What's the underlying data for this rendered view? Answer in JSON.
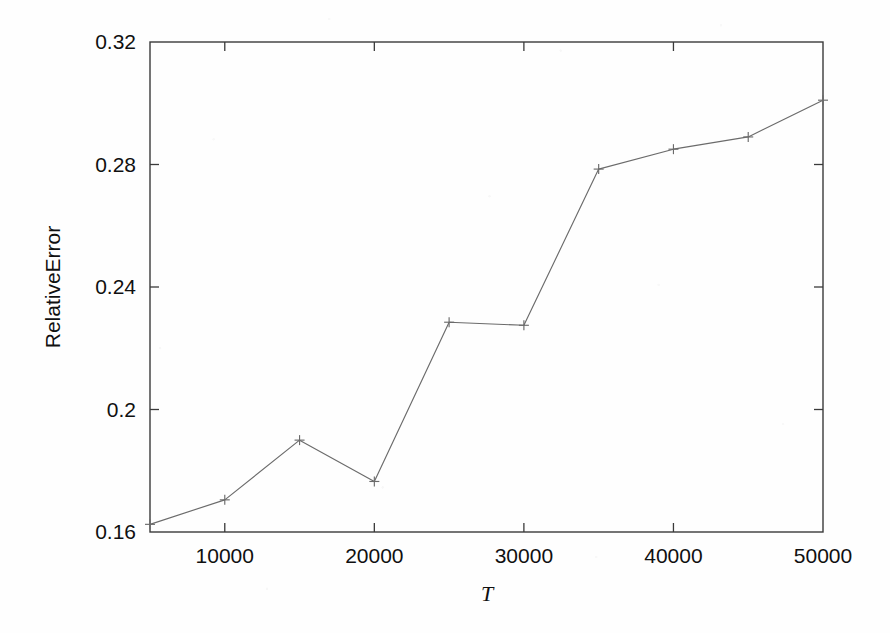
{
  "figure": {
    "background_color": "#fefefe",
    "line_color": "#6b6b6b",
    "axis_color": "#3a3a3a",
    "text_color": "#101010",
    "marker": "plus"
  },
  "chart_data": {
    "type": "line",
    "title": "",
    "subtitle": "",
    "xlabel": "T",
    "ylabel": "RelativeError",
    "x": [
      5000,
      10000,
      15000,
      20000,
      25000,
      30000,
      35000,
      40000,
      45000,
      50000
    ],
    "values": [
      0.1625,
      0.1705,
      0.19,
      0.1765,
      0.2285,
      0.2275,
      0.2785,
      0.285,
      0.289,
      0.301
    ],
    "series": [
      {
        "name": "RelativeError",
        "values": [
          0.1625,
          0.1705,
          0.19,
          0.1765,
          0.2285,
          0.2275,
          0.2785,
          0.285,
          0.289,
          0.301
        ]
      }
    ],
    "xlim": [
      5000,
      50000
    ],
    "ylim": [
      0.16,
      0.32
    ],
    "xticks": [
      10000,
      20000,
      30000,
      40000,
      50000
    ],
    "xticklabels": [
      "10000",
      "20000",
      "30000",
      "40000",
      "50000"
    ],
    "yticks": [
      0.16,
      0.2,
      0.24,
      0.28,
      0.32
    ],
    "yticklabels": [
      "0.16",
      "0.2",
      "0.24",
      "0.28",
      "0.32"
    ],
    "grid": false,
    "legend": null,
    "legend_position": "none",
    "annotations": [],
    "marker_style": "plus",
    "frame": "full-box"
  }
}
